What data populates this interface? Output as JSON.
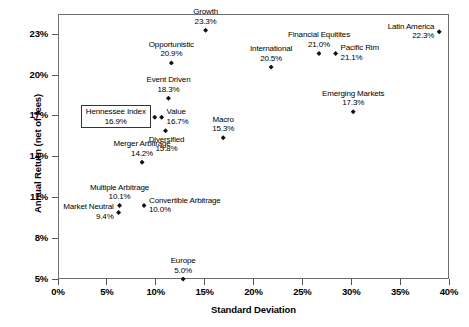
{
  "chart_data": {
    "type": "scatter",
    "title": "",
    "xlabel": "Standard Deviation",
    "ylabel": "Annual Return (net of fees)",
    "xlim": [
      0,
      40
    ],
    "ylim": [
      5,
      24.5
    ],
    "grid": false,
    "legend": "none",
    "xticks": [
      "0%",
      "5%",
      "10%",
      "15%",
      "20%",
      "25%",
      "30%",
      "35%",
      "40%"
    ],
    "xtick_values": [
      0,
      5,
      10,
      15,
      20,
      25,
      30,
      35,
      40
    ],
    "yticks": [
      "5%",
      "8%",
      "11%",
      "14%",
      "17%",
      "20%",
      "23%"
    ],
    "ytick_values": [
      5,
      8,
      11,
      14,
      17,
      20,
      23
    ],
    "points": [
      {
        "name": "Growth",
        "value": "23.3%",
        "x": 15.1,
        "y": 23.3,
        "label_pos": "above-center",
        "highlight": false
      },
      {
        "name": "Latin America",
        "value": "22.3%",
        "x": 39.0,
        "y": 23.2,
        "label_pos": "left",
        "highlight": false
      },
      {
        "name": "Pacific Rim",
        "value": "21.1%",
        "x": 28.4,
        "y": 21.6,
        "label_pos": "right",
        "highlight": false
      },
      {
        "name": "Financial Equitites",
        "value": "21.0%",
        "x": 26.7,
        "y": 21.6,
        "label_pos": "above-center",
        "highlight": false
      },
      {
        "name": "Opportunistic",
        "value": "20.9%",
        "x": 11.6,
        "y": 20.9,
        "label_pos": "above-center",
        "highlight": false
      },
      {
        "name": "International",
        "value": "20.5%",
        "x": 21.8,
        "y": 20.6,
        "label_pos": "above-center",
        "highlight": false
      },
      {
        "name": "Event Driven",
        "value": "18.3%",
        "x": 11.3,
        "y": 18.3,
        "label_pos": "above-center",
        "highlight": false
      },
      {
        "name": "Emerging Markets",
        "value": "17.3%",
        "x": 30.2,
        "y": 17.3,
        "label_pos": "above-center",
        "highlight": false
      },
      {
        "name": "Hennessee Index",
        "value": "16.9%",
        "x": 9.9,
        "y": 16.9,
        "label_pos": "boxed-left",
        "highlight": true
      },
      {
        "name": "Value",
        "value": "16.7%",
        "x": 10.6,
        "y": 16.9,
        "label_pos": "right",
        "highlight": false
      },
      {
        "name": "Diversified",
        "value": "15.8%",
        "x": 11.0,
        "y": 15.9,
        "label_pos": "below-right",
        "highlight": false
      },
      {
        "name": "Macro",
        "value": "15.3%",
        "x": 16.9,
        "y": 15.4,
        "label_pos": "above-center",
        "highlight": false
      },
      {
        "name": "Merger Arbitrage",
        "value": "14.2%",
        "x": 8.6,
        "y": 13.6,
        "label_pos": "above-center",
        "highlight": false
      },
      {
        "name": "Multiple Arbitrage",
        "value": "10.1%",
        "x": 6.3,
        "y": 10.4,
        "label_pos": "above-center",
        "highlight": false
      },
      {
        "name": "Convertible Arbitrage",
        "value": "10.0%",
        "x": 8.8,
        "y": 10.4,
        "label_pos": "right",
        "highlight": false
      },
      {
        "name": "Market Neutral",
        "value": "9.4%",
        "x": 6.2,
        "y": 9.9,
        "label_pos": "left",
        "highlight": false
      },
      {
        "name": "Europe",
        "value": "5.0%",
        "x": 12.8,
        "y": 5.0,
        "label_pos": "above-center",
        "highlight": false
      }
    ]
  }
}
